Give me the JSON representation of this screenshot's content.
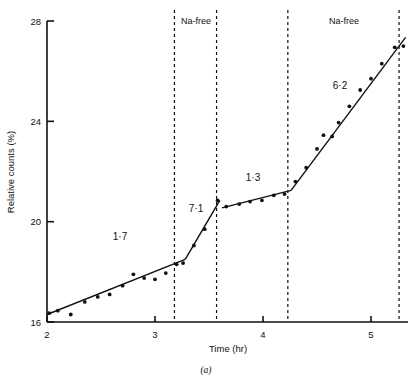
{
  "figure": {
    "caption": "(a)",
    "xlabel": "Time (hr)",
    "ylabel": "Relative counts (%)"
  },
  "axis": {
    "x_ticks": [
      "2",
      "3",
      "4",
      "5"
    ],
    "y_ticks": [
      "16",
      "20",
      "24",
      "28"
    ]
  },
  "annotations": {
    "na_free_1": "Na-free",
    "na_free_2": "Na-free",
    "slope_1": "1·7",
    "slope_2": "7·1",
    "slope_3": "1·3",
    "slope_4": "6·2"
  },
  "chart_data": {
    "type": "scatter",
    "title": "",
    "subtitle": "",
    "xlabel": "Time (hr)",
    "ylabel": "Relative counts (%)",
    "caption": "(a)",
    "xlim": [
      2.0,
      5.35
    ],
    "ylim": [
      16,
      28
    ],
    "x_ticks": [
      2,
      3,
      4,
      5
    ],
    "y_ticks": [
      16,
      20,
      24,
      28
    ],
    "grid": false,
    "legend": null,
    "points": [
      {
        "x": 2.02,
        "y": 16.35
      },
      {
        "x": 2.1,
        "y": 16.45
      },
      {
        "x": 2.22,
        "y": 16.3
      },
      {
        "x": 2.35,
        "y": 16.8
      },
      {
        "x": 2.47,
        "y": 17.0
      },
      {
        "x": 2.58,
        "y": 17.1
      },
      {
        "x": 2.7,
        "y": 17.45
      },
      {
        "x": 2.8,
        "y": 17.9
      },
      {
        "x": 2.9,
        "y": 17.75
      },
      {
        "x": 3.0,
        "y": 17.7
      },
      {
        "x": 3.1,
        "y": 17.95
      },
      {
        "x": 3.2,
        "y": 18.3
      },
      {
        "x": 3.26,
        "y": 18.35
      },
      {
        "x": 3.36,
        "y": 19.05
      },
      {
        "x": 3.46,
        "y": 19.7
      },
      {
        "x": 3.58,
        "y": 20.85
      },
      {
        "x": 3.66,
        "y": 20.6
      },
      {
        "x": 3.78,
        "y": 20.7
      },
      {
        "x": 3.88,
        "y": 20.8
      },
      {
        "x": 3.99,
        "y": 20.85
      },
      {
        "x": 4.1,
        "y": 21.05
      },
      {
        "x": 4.2,
        "y": 21.1
      },
      {
        "x": 4.3,
        "y": 21.6
      },
      {
        "x": 4.4,
        "y": 22.15
      },
      {
        "x": 4.5,
        "y": 22.9
      },
      {
        "x": 4.56,
        "y": 23.45
      },
      {
        "x": 4.64,
        "y": 23.4
      },
      {
        "x": 4.7,
        "y": 23.95
      },
      {
        "x": 4.8,
        "y": 24.6
      },
      {
        "x": 4.9,
        "y": 25.25
      },
      {
        "x": 5.0,
        "y": 25.7
      },
      {
        "x": 5.1,
        "y": 26.3
      },
      {
        "x": 5.22,
        "y": 26.95
      },
      {
        "x": 5.3,
        "y": 27.0
      }
    ],
    "fit_segments": [
      {
        "slope_label": "1·7",
        "x0": 2.0,
        "y0": 16.3,
        "x1": 3.28,
        "y1": 18.5
      },
      {
        "slope_label": "7·1",
        "x0": 3.28,
        "y0": 18.5,
        "x1": 3.6,
        "y1": 20.85
      },
      {
        "slope_label": "1·3",
        "x0": 3.62,
        "y0": 20.55,
        "x1": 4.26,
        "y1": 21.25
      },
      {
        "slope_label": "6·2",
        "x0": 4.26,
        "y0": 21.25,
        "x1": 5.32,
        "y1": 27.35
      }
    ],
    "event_lines": [
      {
        "x": 3.18,
        "label": "Na-free",
        "role": "na-free-start-1"
      },
      {
        "x": 3.57,
        "label": "",
        "role": "na-free-end-1"
      },
      {
        "x": 4.23,
        "label": "Na-free",
        "role": "na-free-start-2"
      },
      {
        "x": 5.26,
        "label": "",
        "role": "na-free-end-2"
      }
    ]
  }
}
